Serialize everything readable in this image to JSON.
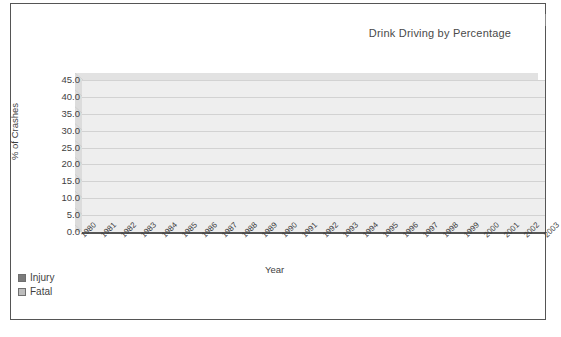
{
  "chart_data": {
    "type": "area",
    "title": "Drink Driving by Percentage",
    "xlabel": "Year",
    "ylabel": "% of Crashes",
    "stacked": true,
    "grid": true,
    "legend_position": "bottom-left",
    "ylim": [
      0,
      45
    ],
    "yticks": [
      "0.0",
      "5.0",
      "10.0",
      "15.0",
      "20.0",
      "25.0",
      "30.0",
      "35.0",
      "40.0",
      "45.0"
    ],
    "categories": [
      "1980",
      "1981",
      "1982",
      "1983",
      "1984",
      "1985",
      "1986",
      "1987",
      "1988",
      "1989",
      "1990",
      "1991",
      "1992",
      "1993",
      "1994",
      "1995",
      "1996",
      "1997",
      "1998",
      "1999",
      "2000",
      "2001",
      "2002",
      "2003"
    ],
    "series": [
      {
        "name": "Injury",
        "color": "#7b7b7b",
        "values": [
          20.4,
          20.6,
          20.6,
          20.6,
          20.4,
          20.2,
          20.2,
          20.3,
          20.5,
          20.8,
          21.4,
          21.5,
          20.9,
          20.6,
          20.4,
          19.3,
          18.2,
          17.3,
          16.6,
          16.0,
          15.6,
          15.0,
          14.6,
          13.6
        ]
      },
      {
        "name": "Fatal",
        "color": "#bdbdbd",
        "values": [
          17.8,
          16.3,
          19.9,
          19.9,
          19.2,
          19.1,
          19.0,
          20.2,
          20.6,
          21.2,
          20.6,
          21.3,
          21.2,
          20.1,
          18.3,
          16.2,
          13.7,
          12.5,
          12.7,
          11.0,
          11.4,
          13.4,
          14.3,
          19.4
        ]
      }
    ],
    "totals": [
      38.2,
      36.9,
      40.5,
      40.5,
      39.6,
      39.3,
      39.2,
      40.5,
      41.1,
      42.0,
      42.0,
      42.8,
      42.1,
      40.7,
      38.7,
      35.5,
      31.9,
      29.8,
      29.3,
      27.0,
      27.0,
      28.4,
      28.9,
      33.0
    ]
  },
  "legend": {
    "items": [
      {
        "label": "Injury",
        "color": "#7b7b7b"
      },
      {
        "label": "Fatal",
        "color": "#bdbdbd"
      }
    ]
  }
}
